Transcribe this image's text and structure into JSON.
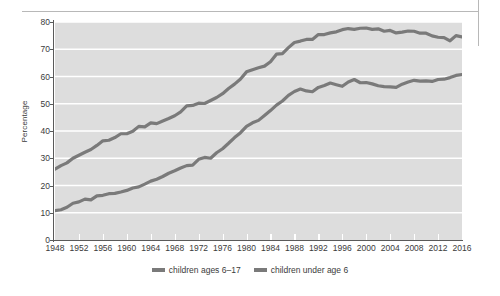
{
  "chart_data": {
    "type": "line",
    "title": "",
    "xlabel": "",
    "ylabel": "Percentage",
    "xlim": [
      1948,
      2016
    ],
    "ylim": [
      0,
      80
    ],
    "grid": "horizontal",
    "legend_position": "bottom-center",
    "plot_background": "#dddddd",
    "line_color": "#7a7a7a",
    "gridline_color": "#ffffff",
    "axis_color": "#5a5a5a",
    "y_ticks": [
      0,
      10,
      20,
      30,
      40,
      50,
      60,
      70,
      80
    ],
    "x_ticks": [
      1948,
      1952,
      1956,
      1960,
      1964,
      1968,
      1972,
      1976,
      1980,
      1984,
      1988,
      1992,
      1996,
      2000,
      2004,
      2008,
      2012,
      2016
    ],
    "x": [
      1948,
      1949,
      1950,
      1951,
      1952,
      1953,
      1954,
      1955,
      1956,
      1957,
      1958,
      1959,
      1960,
      1961,
      1962,
      1963,
      1964,
      1965,
      1966,
      1967,
      1968,
      1969,
      1970,
      1971,
      1972,
      1973,
      1974,
      1975,
      1976,
      1977,
      1978,
      1979,
      1980,
      1981,
      1982,
      1983,
      1984,
      1985,
      1986,
      1987,
      1988,
      1989,
      1990,
      1991,
      1992,
      1993,
      1994,
      1995,
      1996,
      1997,
      1998,
      1999,
      2000,
      2001,
      2002,
      2003,
      2004,
      2005,
      2006,
      2007,
      2008,
      2009,
      2010,
      2011,
      2012,
      2013,
      2014,
      2015,
      2016
    ],
    "series": [
      {
        "name": "children ages 6–17",
        "values": [
          26.0,
          27.3,
          28.3,
          30.0,
          31.1,
          32.2,
          33.2,
          34.7,
          36.4,
          36.6,
          37.6,
          39.0,
          39.0,
          39.9,
          41.7,
          41.5,
          43.0,
          42.7,
          43.7,
          44.6,
          45.6,
          47.0,
          49.2,
          49.4,
          50.2,
          50.1,
          51.2,
          52.3,
          53.7,
          55.6,
          57.2,
          59.1,
          61.7,
          62.5,
          63.2,
          63.8,
          65.4,
          68.2,
          68.4,
          70.6,
          72.5,
          73.0,
          73.6,
          73.6,
          75.4,
          75.4,
          76.0,
          76.4,
          77.2,
          77.6,
          77.3,
          77.7,
          77.8,
          77.3,
          77.5,
          76.6,
          76.9,
          76.0,
          76.3,
          76.7,
          76.6,
          75.9,
          75.9,
          74.9,
          74.4,
          74.3,
          73.1,
          75.0,
          74.5
        ]
      },
      {
        "name": "children under age 6",
        "values": [
          10.8,
          11.1,
          12.0,
          13.5,
          14.0,
          15.0,
          14.7,
          16.2,
          16.4,
          17.0,
          17.1,
          17.6,
          18.2,
          19.1,
          19.5,
          20.5,
          21.6,
          22.3,
          23.3,
          24.5,
          25.4,
          26.4,
          27.3,
          27.5,
          29.6,
          30.3,
          30.0,
          32.0,
          33.5,
          35.5,
          37.6,
          39.4,
          41.7,
          43.0,
          43.9,
          45.7,
          47.5,
          49.5,
          51.0,
          53.1,
          54.5,
          55.4,
          54.7,
          54.4,
          56.0,
          56.7,
          57.6,
          57.0,
          56.4,
          58.0,
          58.9,
          57.7,
          57.8,
          57.3,
          56.6,
          56.3,
          56.2,
          56.0,
          57.2,
          58.0,
          58.6,
          58.3,
          58.4,
          58.2,
          58.9,
          59.0,
          59.6,
          60.4,
          60.7
        ]
      }
    ]
  },
  "legend": {
    "items": [
      {
        "label": "children ages 6–17"
      },
      {
        "label": "children under age 6"
      }
    ]
  },
  "axes": {
    "y_title": "Percentage"
  }
}
